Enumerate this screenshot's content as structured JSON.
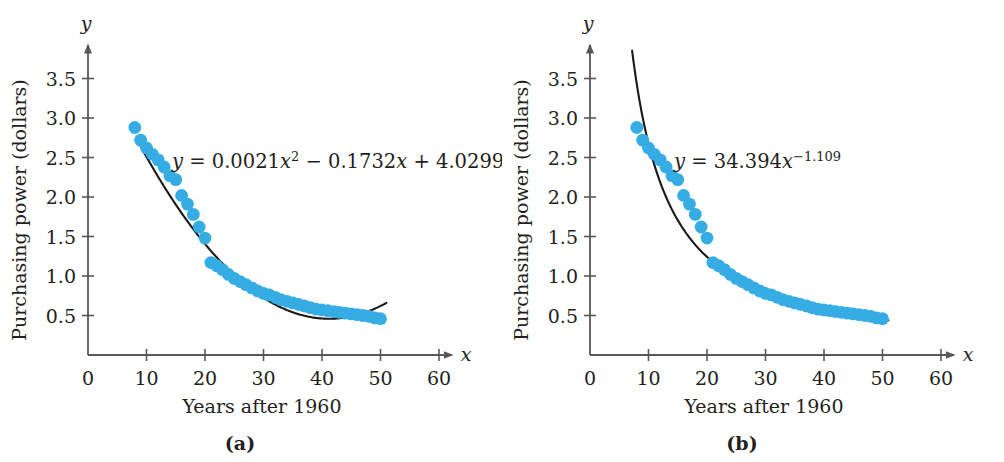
{
  "figure": {
    "top_fragment": "",
    "background": "#ffffff",
    "point_color": "#35ade4",
    "curve_color": "#1a1a1a",
    "axis_color": "#58585a"
  },
  "panels": [
    {
      "key": "a",
      "label": "(a)",
      "equation": {
        "lhs": "y",
        "eq": " = ",
        "body_1": "0.0021",
        "var_1": "x",
        "exp_1": "2",
        "op_1": " − ",
        "body_2": "0.1732",
        "var_2": "x",
        "op_2": " + ",
        "body_3": "4.0299",
        "plain": "y = 0.0021x2 − 0.1732x + 4.0299"
      },
      "axes": {
        "x_name": "x",
        "y_name": "y",
        "x_title": "Years after 1960",
        "y_title": "Purchasing power (dollars)",
        "x_ticks": [
          0,
          10,
          20,
          30,
          40,
          50,
          60
        ],
        "x_tick_labels": [
          "0",
          "10",
          "20",
          "30",
          "40",
          "50",
          "60"
        ],
        "y_ticks": [
          0.5,
          1.0,
          1.5,
          2.0,
          2.5,
          3.0,
          3.5
        ],
        "y_tick_labels": [
          "0.5",
          "1.0",
          "1.5",
          "2.0",
          "2.5",
          "3.0",
          "3.5"
        ],
        "xlim": [
          0,
          63
        ],
        "ylim": [
          0,
          3.8
        ]
      }
    },
    {
      "key": "b",
      "label": "(b)",
      "equation": {
        "lhs": "y",
        "eq": " = ",
        "body_1": "34.394",
        "var_1": "x",
        "exp_1": "−1.109",
        "plain": "y = 34.394x−1.109"
      },
      "axes": {
        "x_name": "x",
        "y_name": "y",
        "x_title": "Years after 1960",
        "y_title": "Purchasing power (dollars)",
        "x_ticks": [
          0,
          10,
          20,
          30,
          40,
          50,
          60
        ],
        "x_tick_labels": [
          "0",
          "10",
          "20",
          "30",
          "40",
          "50",
          "60"
        ],
        "y_ticks": [
          0.5,
          1.0,
          1.5,
          2.0,
          2.5,
          3.0,
          3.5
        ],
        "y_tick_labels": [
          "0.5",
          "1.0",
          "1.5",
          "2.0",
          "2.5",
          "3.0",
          "3.5"
        ],
        "xlim": [
          0,
          63
        ],
        "ylim": [
          0,
          3.8
        ]
      }
    }
  ],
  "chart_data": [
    {
      "type": "scatter",
      "panel": "(a)",
      "title": "",
      "xlabel": "Years after 1960",
      "ylabel": "Purchasing power (dollars)",
      "xlim": [
        0,
        63
      ],
      "ylim": [
        0,
        3.8
      ],
      "xticks": [
        0,
        10,
        20,
        30,
        40,
        50,
        60
      ],
      "yticks": [
        0.5,
        1.0,
        1.5,
        2.0,
        2.5,
        3.0,
        3.5
      ],
      "grid": false,
      "legend": false,
      "annotations": [
        "y = 0.0021x^2 - 0.1732x + 4.0299"
      ],
      "series": [
        {
          "name": "Purchasing power data",
          "marker": "circle",
          "color": "#35ade4",
          "x": [
            8,
            9,
            10,
            11,
            12,
            13,
            14,
            15,
            16,
            17,
            18,
            19,
            20,
            21,
            22,
            23,
            24,
            25,
            26,
            27,
            28,
            29,
            30,
            31,
            32,
            33,
            34,
            35,
            36,
            37,
            38,
            39,
            40,
            41,
            42,
            43,
            44,
            45,
            46,
            47,
            48,
            49,
            50
          ],
          "y": [
            2.88,
            2.72,
            2.62,
            2.54,
            2.47,
            2.38,
            2.27,
            2.22,
            2.02,
            1.91,
            1.78,
            1.62,
            1.48,
            1.17,
            1.13,
            1.08,
            1.02,
            0.97,
            0.93,
            0.89,
            0.85,
            0.81,
            0.78,
            0.76,
            0.73,
            0.7,
            0.68,
            0.66,
            0.64,
            0.62,
            0.6,
            0.58,
            0.57,
            0.56,
            0.55,
            0.54,
            0.53,
            0.52,
            0.51,
            0.5,
            0.49,
            0.47,
            0.46
          ]
        },
        {
          "name": "Quadratic model",
          "marker": "line",
          "color": "#1a1a1a",
          "fit": "y = 0.0021x^2 - 0.1732x + 4.0299",
          "x_range": [
            9,
            51
          ]
        }
      ]
    },
    {
      "type": "scatter",
      "panel": "(b)",
      "title": "",
      "xlabel": "Years after 1960",
      "ylabel": "Purchasing power (dollars)",
      "xlim": [
        0,
        63
      ],
      "ylim": [
        0,
        3.8
      ],
      "xticks": [
        0,
        10,
        20,
        30,
        40,
        50,
        60
      ],
      "yticks": [
        0.5,
        1.0,
        1.5,
        2.0,
        2.5,
        3.0,
        3.5
      ],
      "grid": false,
      "legend": false,
      "annotations": [
        "y = 34.394x^-1.109"
      ],
      "series": [
        {
          "name": "Purchasing power data",
          "marker": "circle",
          "color": "#35ade4",
          "x": [
            8,
            9,
            10,
            11,
            12,
            13,
            14,
            15,
            16,
            17,
            18,
            19,
            20,
            21,
            22,
            23,
            24,
            25,
            26,
            27,
            28,
            29,
            30,
            31,
            32,
            33,
            34,
            35,
            36,
            37,
            38,
            39,
            40,
            41,
            42,
            43,
            44,
            45,
            46,
            47,
            48,
            49,
            50
          ],
          "y": [
            2.88,
            2.72,
            2.62,
            2.54,
            2.47,
            2.38,
            2.27,
            2.22,
            2.02,
            1.91,
            1.78,
            1.62,
            1.48,
            1.17,
            1.13,
            1.08,
            1.02,
            0.97,
            0.93,
            0.89,
            0.85,
            0.81,
            0.78,
            0.76,
            0.73,
            0.7,
            0.68,
            0.66,
            0.64,
            0.62,
            0.6,
            0.58,
            0.57,
            0.56,
            0.55,
            0.54,
            0.53,
            0.52,
            0.51,
            0.5,
            0.49,
            0.47,
            0.46
          ]
        },
        {
          "name": "Power model",
          "marker": "line",
          "color": "#1a1a1a",
          "fit": "y = 34.394x^-1.109",
          "x_range": [
            7.2,
            51
          ]
        }
      ]
    }
  ]
}
